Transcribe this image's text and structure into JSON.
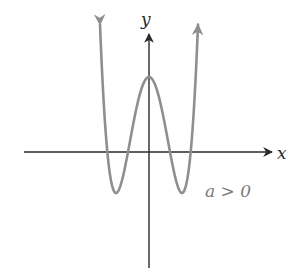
{
  "figure": {
    "axis_labels": {
      "x": "x",
      "y": "y"
    },
    "annotation": "a > 0",
    "colors": {
      "axis": "#2a2a2a",
      "curve": "#8f8f8f",
      "annotation": "#7a7a7a",
      "background": "#ffffff"
    },
    "curve": {
      "description": "W-shaped quartic polynomial, positive leading coefficient, four real roots, local max on y-axis, both ends rising to +infinity",
      "pixel_model": {
        "center_x": 149,
        "axis_y": 152,
        "A": 9.78e-05,
        "m": 33,
        "K": -41,
        "x_start": 100,
        "x_end": 198
      }
    }
  }
}
